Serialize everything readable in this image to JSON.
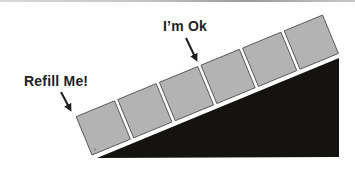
{
  "diagram": {
    "labels": {
      "refill": "Refill Me!",
      "ok": "I’m Ok"
    },
    "ramp": {
      "color": "#151310",
      "points": [
        [
          97,
          158
        ],
        [
          339,
          58
        ],
        [
          339,
          157
        ]
      ]
    },
    "tiles": {
      "count": 6,
      "fill": "#b3b3b3",
      "stroke": "#4a4a4a",
      "angle_deg": -22.4
    },
    "arrows": [
      {
        "name": "refill-arrow",
        "target_tile": 1
      },
      {
        "name": "ok-arrow",
        "target_gap_between_tiles": [
          3,
          4
        ]
      }
    ]
  }
}
